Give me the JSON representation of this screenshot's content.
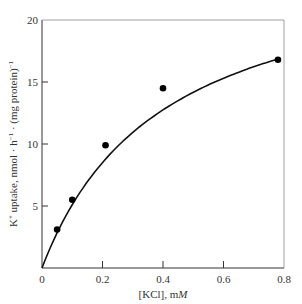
{
  "chart_data": {
    "type": "scatter",
    "title": "",
    "xlabel": "[KCl], mM",
    "ylabel": "K+ uptake, nmol · h−1 · (mg protein)−1",
    "xlim": [
      0,
      0.8
    ],
    "ylim": [
      0,
      20
    ],
    "xticks": [
      "0",
      "0.2",
      "0.4",
      "0.6",
      "0.8"
    ],
    "yticks": [
      "0",
      "5",
      "10",
      "15",
      "20"
    ],
    "grid": false,
    "legend": null,
    "series": [
      {
        "name": "K+ uptake",
        "x": [
          0.05,
          0.1,
          0.21,
          0.4,
          0.78
        ],
        "y": [
          3.1,
          5.5,
          9.9,
          14.5,
          16.8
        ],
        "marker": "filled-circle",
        "fit_curve": "saturating (Michaelis-Menten-like) curve through origin"
      }
    ]
  },
  "labels": {
    "x_axis_main": "[KCl], m",
    "x_axis_unit_italic": "M",
    "y_axis_prefix": "K",
    "y_axis_sup1": "+",
    "y_axis_mid": " uptake, nmol · h",
    "y_axis_sup2": "−1",
    "y_axis_mid2": " · (mg protein)",
    "y_axis_sup3": "−1"
  }
}
